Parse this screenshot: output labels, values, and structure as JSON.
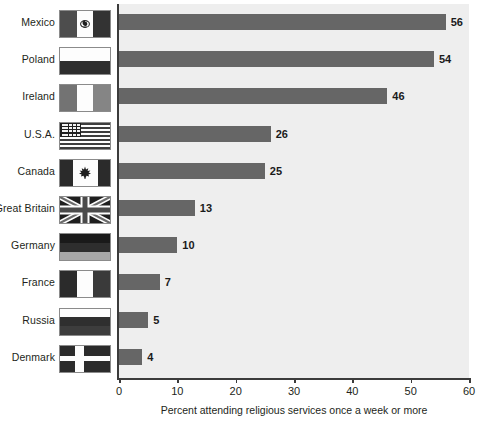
{
  "chart_data": {
    "type": "bar",
    "orientation": "horizontal",
    "title": "",
    "xlabel": "Percent attending religious services once a week or more",
    "ylabel": "",
    "xlim": [
      0,
      60
    ],
    "xticks": [
      0,
      10,
      20,
      30,
      40,
      50,
      60
    ],
    "grid": false,
    "legend": "none",
    "categories": [
      "Mexico",
      "Poland",
      "Ireland",
      "U.S.A.",
      "Canada",
      "Great Britain",
      "Germany",
      "France",
      "Russia",
      "Denmark"
    ],
    "values": [
      56,
      54,
      46,
      26,
      25,
      13,
      10,
      7,
      5,
      4
    ],
    "value_labels": [
      "56",
      "54",
      "46",
      "26",
      "25",
      "13",
      "10",
      "7",
      "5",
      "4"
    ],
    "bar_color": "#666666",
    "plot_background": "#eeeeee",
    "axis_color": "#3b3b3b"
  },
  "rows": [
    {
      "country": "Mexico",
      "value": 56,
      "label": "56",
      "flag": "mexico-flag"
    },
    {
      "country": "Poland",
      "value": 54,
      "label": "54",
      "flag": "poland-flag"
    },
    {
      "country": "Ireland",
      "value": 46,
      "label": "46",
      "flag": "ireland-flag"
    },
    {
      "country": "U.S.A.",
      "value": 26,
      "label": "26",
      "flag": "usa-flag"
    },
    {
      "country": "Canada",
      "value": 25,
      "label": "25",
      "flag": "canada-flag"
    },
    {
      "country": "Great Britain",
      "value": 13,
      "label": "13",
      "flag": "great-britain-flag"
    },
    {
      "country": "Germany",
      "value": 10,
      "label": "10",
      "flag": "germany-flag"
    },
    {
      "country": "France",
      "value": 7,
      "label": "7",
      "flag": "france-flag"
    },
    {
      "country": "Russia",
      "value": 5,
      "label": "5",
      "flag": "russia-flag"
    },
    {
      "country": "Denmark",
      "value": 4,
      "label": "4",
      "flag": "denmark-flag"
    }
  ],
  "axis": {
    "ticks": [
      "0",
      "10",
      "20",
      "30",
      "40",
      "50",
      "60"
    ],
    "caption": "Percent attending religious services once a week or more"
  }
}
